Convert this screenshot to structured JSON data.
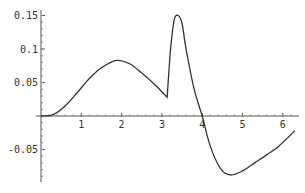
{
  "chart_data": {
    "type": "line",
    "title": "",
    "xlabel": "",
    "ylabel": "",
    "xlim": [
      0,
      6.3
    ],
    "ylim": [
      -0.1,
      0.155
    ],
    "grid": false,
    "legend": null,
    "x_ticks": [
      1,
      2,
      3,
      4,
      5,
      6
    ],
    "x_tick_labels": [
      "1",
      "2",
      "3",
      "4",
      "5",
      "6"
    ],
    "y_ticks": [
      0.15,
      0.1,
      0.05,
      -0.05
    ],
    "y_tick_labels": [
      "0.15",
      "0.1",
      "0.05",
      "-0.05"
    ],
    "series": [
      {
        "name": "f(x)",
        "color": "#333333",
        "x": [
          0,
          0.3,
          0.6,
          0.9,
          1.2,
          1.5,
          1.87,
          2.2,
          2.5,
          2.8,
          3.05,
          3.13,
          3.2,
          3.3,
          3.4,
          3.5,
          3.6,
          3.8,
          4.0,
          4.2,
          4.45,
          4.7,
          5.0,
          5.3,
          5.6,
          5.9,
          6.3
        ],
        "y": [
          0,
          0.002,
          0.015,
          0.035,
          0.056,
          0.072,
          0.083,
          0.078,
          0.064,
          0.048,
          0.033,
          0.028,
          0.09,
          0.142,
          0.15,
          0.138,
          0.1,
          0.04,
          0.0,
          -0.045,
          -0.078,
          -0.088,
          -0.082,
          -0.07,
          -0.058,
          -0.045,
          -0.022
        ]
      }
    ]
  }
}
